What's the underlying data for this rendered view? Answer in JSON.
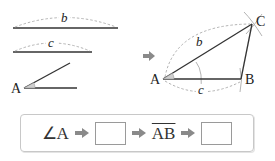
{
  "left_figures": {
    "segment_b": {
      "label": "b"
    },
    "segment_c": {
      "label": "c"
    },
    "angle": {
      "vertex_label": "A"
    }
  },
  "transition_arrow": {
    "icon": "right-arrow-icon"
  },
  "triangle": {
    "vertices": {
      "A": "A",
      "B": "B",
      "C": "C"
    },
    "side_labels": {
      "b": "b",
      "c": "c"
    }
  },
  "flow": {
    "steps": [
      {
        "type": "text",
        "value": "∠A"
      },
      {
        "type": "arrow",
        "icon": "right-arrow-icon"
      },
      {
        "type": "blank",
        "value": ""
      },
      {
        "type": "arrow",
        "icon": "right-arrow-icon"
      },
      {
        "type": "text",
        "value": "AB",
        "overline": true
      },
      {
        "type": "arrow",
        "icon": "right-arrow-icon"
      },
      {
        "type": "blank",
        "value": ""
      }
    ],
    "step1": "∠A",
    "step3": "AB"
  },
  "colors": {
    "line": "#333333",
    "dashed_arc": "#aaaaaa",
    "arrow": "#8a8a8a",
    "box_border": "#c8c8c8"
  }
}
